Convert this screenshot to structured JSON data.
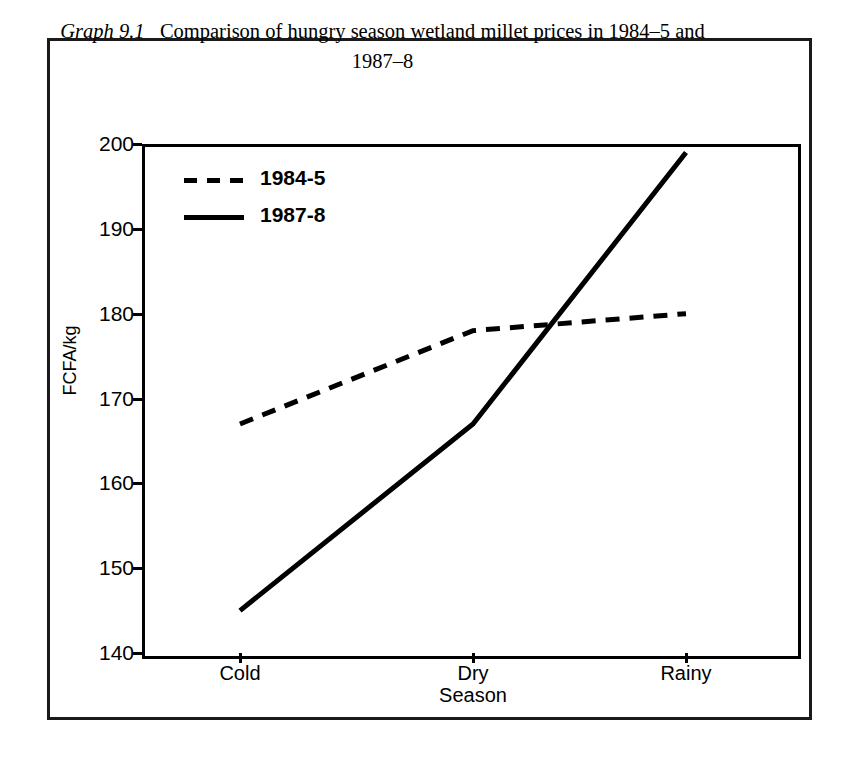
{
  "figure": {
    "graph_label": "Graph 9.1",
    "caption": "Comparison of hungry season wetland millet prices in 1984–5 and 1987–8",
    "border_color": "#1a1a1a"
  },
  "legend": {
    "position": "top-left-inside",
    "entries": [
      {
        "label": "1984-5",
        "style": "dashed",
        "color": "#000000"
      },
      {
        "label": "1987-8",
        "style": "solid",
        "color": "#000000"
      }
    ]
  },
  "axes": {
    "ylabel": "FCFA/kg",
    "xlabel": "Season",
    "yticks": [
      "200",
      "190",
      "180",
      "170",
      "160",
      "150",
      "140"
    ],
    "xticks": [
      "Cold",
      "Dry",
      "Rainy"
    ]
  },
  "chart_data": {
    "type": "line",
    "title": "Comparison of hungry season wetland millet prices in 1984–5 and 1987–8",
    "xlabel": "Season",
    "ylabel": "FCFA/kg",
    "categories": [
      "Cold",
      "Dry",
      "Rainy"
    ],
    "series": [
      {
        "name": "1984-5",
        "style": "dashed",
        "color": "#000000",
        "values": [
          167,
          178,
          180
        ]
      },
      {
        "name": "1987-8",
        "style": "solid",
        "color": "#000000",
        "values": [
          145,
          167,
          199
        ]
      }
    ],
    "ylim": [
      140,
      200
    ],
    "ytick_values": [
      140,
      150,
      160,
      170,
      180,
      190,
      200
    ],
    "grid": false,
    "legend_position": "upper left",
    "annotations": []
  }
}
